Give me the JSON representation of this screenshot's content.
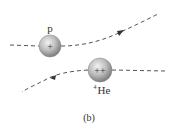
{
  "diagram": {
    "caption": "(b)",
    "particles": [
      {
        "id": "proton",
        "label": "p",
        "charge": "+",
        "cx": 50,
        "cy": 46,
        "r": 11
      },
      {
        "id": "helium",
        "label_sup": "4",
        "label": "He",
        "charge": "++",
        "cx": 100,
        "cy": 70,
        "r": 12
      }
    ],
    "trajectories": [
      {
        "id": "proton-path",
        "direction": "right"
      },
      {
        "id": "helium-path",
        "direction": "left"
      }
    ],
    "colors": {
      "line": "#555555",
      "sphere_light": "#e6e6e6",
      "sphere_dark": "#8a8a8a",
      "text": "#333333"
    }
  }
}
